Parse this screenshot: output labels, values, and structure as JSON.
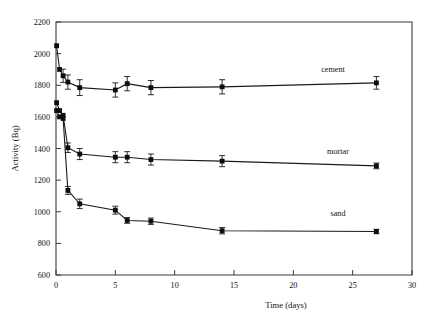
{
  "chart_data": {
    "type": "line",
    "title": "",
    "xlabel": "Time (days)",
    "ylabel": "Activity (Bq)",
    "xlim": [
      0,
      30
    ],
    "ylim": [
      600,
      2200
    ],
    "xticks": [
      0,
      5,
      10,
      15,
      20,
      25,
      30
    ],
    "yticks": [
      600,
      800,
      1000,
      1200,
      1400,
      1600,
      1800,
      2000,
      2200
    ],
    "grid": false,
    "legend_position": "inline-right-of-series",
    "marker": "square",
    "error_bars": true,
    "series": [
      {
        "name": "cement",
        "label": "cement",
        "color": "#111111",
        "x": [
          0.05,
          0.3,
          0.6,
          1.0,
          2.0,
          5.0,
          6.0,
          8.0,
          14.0,
          27.0
        ],
        "y": [
          2050,
          1900,
          1860,
          1820,
          1785,
          1770,
          1810,
          1785,
          1790,
          1815
        ],
        "yerr": [
          0,
          0,
          42,
          45,
          50,
          45,
          45,
          45,
          45,
          40
        ]
      },
      {
        "name": "mortar",
        "label": "mortar",
        "color": "#111111",
        "x": [
          0.05,
          0.3,
          0.6,
          1.0,
          2.0,
          5.0,
          6.0,
          8.0,
          14.0,
          27.0
        ],
        "y": [
          1690,
          1640,
          1610,
          1405,
          1365,
          1345,
          1345,
          1330,
          1320,
          1290
        ],
        "yerr": [
          0,
          0,
          0,
          30,
          35,
          35,
          35,
          35,
          35,
          18
        ]
      },
      {
        "name": "sand",
        "label": "sand",
        "color": "#111111",
        "x": [
          0.05,
          0.3,
          0.6,
          1.0,
          2.0,
          5.0,
          6.0,
          8.0,
          14.0,
          27.0
        ],
        "y": [
          1640,
          1600,
          1590,
          1135,
          1050,
          1010,
          945,
          940,
          880,
          875
        ],
        "yerr": [
          0,
          0,
          0,
          25,
          30,
          25,
          18,
          20,
          20,
          14
        ]
      }
    ],
    "series_labels": [
      {
        "name": "cement",
        "text": "cement",
        "x_px": 333,
        "y_px": 72
      },
      {
        "name": "mortar",
        "text": "mortar",
        "x_px": 338,
        "y_px": 154
      },
      {
        "name": "sand",
        "text": "sand",
        "x_px": 338,
        "y_px": 216
      }
    ]
  }
}
